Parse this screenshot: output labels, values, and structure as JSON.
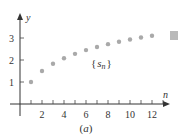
{
  "chart_data": {
    "type": "scatter",
    "title": "",
    "caption": "(a)",
    "xlabel": "n",
    "ylabel": "y",
    "series_label": "{s_n}",
    "x": [
      1,
      2,
      3,
      4,
      5,
      6,
      7,
      8,
      9,
      10,
      11,
      12
    ],
    "values": [
      1.0,
      1.5,
      1.83,
      2.08,
      2.28,
      2.45,
      2.59,
      2.72,
      2.83,
      2.93,
      3.02,
      3.1
    ],
    "x_ticks": [
      2,
      4,
      6,
      8,
      10,
      12
    ],
    "y_ticks": [
      1,
      2,
      3
    ],
    "xlim": [
      0,
      13.5
    ],
    "ylim": [
      0,
      3.8
    ],
    "grid": false,
    "point_color": "#a9a9a9"
  },
  "labels": {
    "x_axis": "n",
    "y_axis": "y",
    "series": "{s",
    "series_sub": "n",
    "series_close": "}",
    "caption": "(a)"
  }
}
